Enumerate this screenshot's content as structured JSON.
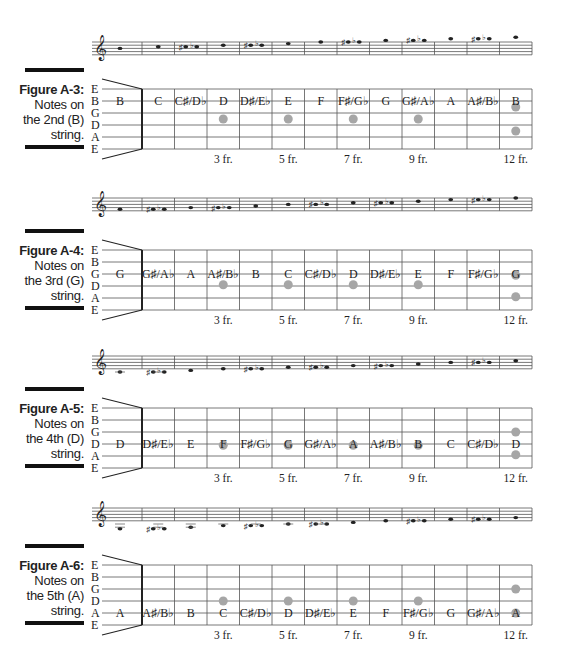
{
  "string_names": [
    "E",
    "B",
    "G",
    "D",
    "A",
    "E"
  ],
  "fret_markers": [
    {
      "fret": 3,
      "label": "3 fr."
    },
    {
      "fret": 5,
      "label": "5 fr."
    },
    {
      "fret": 7,
      "label": "7 fr."
    },
    {
      "fret": 9,
      "label": "9 fr."
    },
    {
      "fret": 12,
      "label": "12 fr."
    }
  ],
  "colors": {
    "dot": "#a6a6a6",
    "line": "#555555",
    "bar": "#111111"
  },
  "figures": [
    {
      "id": "A-3",
      "title": "Figure A-3:",
      "caption_lines": [
        "Notes on",
        "the 2nd (B)",
        "string."
      ],
      "string_index": 1,
      "notes": [
        "B",
        "C",
        "C♯/D♭",
        "D",
        "D♯/E♭",
        "E",
        "F",
        "F♯/G♭",
        "G",
        "G♯/A♭",
        "A",
        "A♯/B♭",
        "B"
      ],
      "dots": [
        {
          "fret": 3,
          "string": 2
        },
        {
          "fret": 5,
          "string": 2
        },
        {
          "fret": 7,
          "string": 2
        },
        {
          "fret": 9,
          "string": 2
        },
        {
          "fret": 12,
          "string": 1
        },
        {
          "fret": 12,
          "string": 3
        }
      ],
      "staff_notes": [
        {
          "type": "n",
          "pos": 4
        },
        {
          "type": "n",
          "pos": 5
        },
        {
          "type": "a",
          "pos": 5
        },
        {
          "type": "n",
          "pos": 6
        },
        {
          "type": "a",
          "pos": 6
        },
        {
          "type": "n",
          "pos": 7
        },
        {
          "type": "n",
          "pos": 8
        },
        {
          "type": "a",
          "pos": 8
        },
        {
          "type": "n",
          "pos": 9
        },
        {
          "type": "a",
          "pos": 9
        },
        {
          "type": "n",
          "pos": 10
        },
        {
          "type": "a",
          "pos": 10
        },
        {
          "type": "n",
          "pos": 11
        }
      ]
    },
    {
      "id": "A-4",
      "title": "Figure A-4:",
      "caption_lines": [
        "Notes on",
        "the 3rd (G)",
        "string."
      ],
      "string_index": 2,
      "notes": [
        "G",
        "G♯/A♭",
        "A",
        "A♯/B♭",
        "B",
        "C",
        "C♯/D♭",
        "D",
        "D♯/E♭",
        "E",
        "F",
        "F♯/G♭",
        "G"
      ],
      "dots": [
        {
          "fret": 3,
          "string": 2.4
        },
        {
          "fret": 5,
          "string": 2.4
        },
        {
          "fret": 7,
          "string": 2.4
        },
        {
          "fret": 9,
          "string": 2.4
        },
        {
          "fret": 12,
          "string": 1.6
        },
        {
          "fret": 12,
          "string": 3.4
        }
      ],
      "staff_notes": [
        {
          "type": "n",
          "pos": 1
        },
        {
          "type": "a",
          "pos": 1
        },
        {
          "type": "n",
          "pos": 2
        },
        {
          "type": "a",
          "pos": 2
        },
        {
          "type": "n",
          "pos": 3
        },
        {
          "type": "n",
          "pos": 4
        },
        {
          "type": "a",
          "pos": 4
        },
        {
          "type": "n",
          "pos": 5
        },
        {
          "type": "a",
          "pos": 5
        },
        {
          "type": "n",
          "pos": 6
        },
        {
          "type": "n",
          "pos": 7
        },
        {
          "type": "a",
          "pos": 7
        },
        {
          "type": "n",
          "pos": 8
        }
      ]
    },
    {
      "id": "A-5",
      "title": "Figure A-5:",
      "caption_lines": [
        "Notes on",
        "the 4th (D)",
        "string."
      ],
      "string_index": 3,
      "notes": [
        "D",
        "D♯/E♭",
        "E",
        "F",
        "F♯/G♭",
        "G",
        "G♯/A♭",
        "A",
        "A♯/B♭",
        "B",
        "C",
        "C♯/D♭",
        "D"
      ],
      "dots": [
        {
          "fret": 3,
          "string": 2.6
        },
        {
          "fret": 5,
          "string": 2.6
        },
        {
          "fret": 7,
          "string": 2.6
        },
        {
          "fret": 9,
          "string": 2.6
        },
        {
          "fret": 12,
          "string": 1.5
        },
        {
          "fret": 12,
          "string": 3.4
        }
      ],
      "staff_notes": [
        {
          "type": "n",
          "pos": -2
        },
        {
          "type": "a",
          "pos": -2
        },
        {
          "type": "n",
          "pos": -1
        },
        {
          "type": "n",
          "pos": 0
        },
        {
          "type": "a",
          "pos": 0
        },
        {
          "type": "n",
          "pos": 1
        },
        {
          "type": "a",
          "pos": 1
        },
        {
          "type": "n",
          "pos": 2
        },
        {
          "type": "a",
          "pos": 2
        },
        {
          "type": "n",
          "pos": 3
        },
        {
          "type": "n",
          "pos": 4
        },
        {
          "type": "a",
          "pos": 4
        },
        {
          "type": "n",
          "pos": 5
        }
      ]
    },
    {
      "id": "A-6",
      "title": "Figure A-6:",
      "caption_lines": [
        "Notes on",
        "the 5th (A)",
        "string."
      ],
      "string_index": 4,
      "notes": [
        "A",
        "A♯/B♭",
        "B",
        "C",
        "C♯/D♭",
        "D",
        "D♯/E♭",
        "E",
        "F",
        "F♯/G♭",
        "G",
        "G♯/A♭",
        "A"
      ],
      "dots": [
        {
          "fret": 3,
          "string": 2.5
        },
        {
          "fret": 5,
          "string": 2.5
        },
        {
          "fret": 7,
          "string": 2.5
        },
        {
          "fret": 9,
          "string": 2.5
        },
        {
          "fret": 12,
          "string": 1.5
        },
        {
          "fret": 12,
          "string": 3.5
        }
      ],
      "staff_notes": [
        {
          "type": "n",
          "pos": -5
        },
        {
          "type": "a",
          "pos": -5
        },
        {
          "type": "n",
          "pos": -4
        },
        {
          "type": "n",
          "pos": -3
        },
        {
          "type": "a",
          "pos": -3
        },
        {
          "type": "n",
          "pos": -2
        },
        {
          "type": "a",
          "pos": -2
        },
        {
          "type": "n",
          "pos": -1
        },
        {
          "type": "n",
          "pos": 0
        },
        {
          "type": "a",
          "pos": 0
        },
        {
          "type": "n",
          "pos": 1
        },
        {
          "type": "a",
          "pos": 1
        },
        {
          "type": "n",
          "pos": 2
        }
      ]
    }
  ]
}
